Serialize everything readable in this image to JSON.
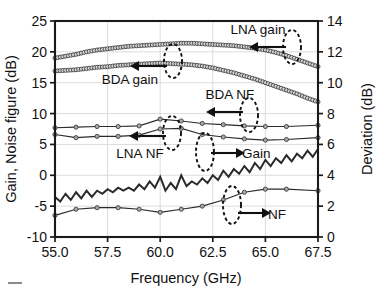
{
  "figure": {
    "name": "gain-noise-figure-vs-frequency-plot"
  },
  "axes": {
    "x_title": "Frequency (GHz)",
    "y_left_title": "Gain, Noise figure (dB)",
    "y_right_title": "Deviation (dB)",
    "x_ticks": [
      "55.0",
      "57.5",
      "60.0",
      "62.5",
      "65.0",
      "67.5"
    ],
    "y_left_ticks": [
      "-10",
      "-5",
      "0",
      "5",
      "10",
      "15",
      "20",
      "25"
    ],
    "y_right_ticks": [
      "0",
      "2",
      "4",
      "6",
      "8",
      "10",
      "12",
      "14"
    ]
  },
  "annotations": [
    {
      "label": "LNA gain",
      "arrow": "left"
    },
    {
      "label": "BDA gain",
      "arrow": "left"
    },
    {
      "label": "BDA NF",
      "arrow": "left"
    },
    {
      "label": "LNA NF",
      "arrow": "left"
    },
    {
      "label": "Gain",
      "arrow": "right"
    },
    {
      "label": "NF",
      "arrow": "right"
    }
  ],
  "chart_data": {
    "type": "line",
    "title": "",
    "xlabel": "Frequency (GHz)",
    "ylabel": "Gain, Noise figure (dB)",
    "y2label": "Deviation (dB)",
    "xlim": [
      55.0,
      67.5
    ],
    "ylim": [
      -10,
      25
    ],
    "y2lim": [
      0,
      14
    ],
    "grid": true,
    "legend_position": "inline-annotations",
    "series": [
      {
        "name": "LNA gain",
        "axis": "left",
        "unit": "dB",
        "marker": "open-circle",
        "x": [
          55.0,
          55.5,
          56.0,
          56.5,
          57.0,
          57.5,
          58.0,
          58.5,
          59.0,
          59.5,
          60.0,
          60.5,
          61.0,
          61.5,
          62.0,
          62.5,
          63.0,
          63.5,
          64.0,
          64.5,
          65.0,
          65.5,
          66.0,
          66.5,
          67.0,
          67.5
        ],
        "values": [
          19.0,
          19.3,
          19.6,
          20.0,
          20.3,
          20.5,
          20.7,
          20.9,
          21.0,
          21.1,
          21.2,
          21.3,
          21.4,
          21.4,
          21.3,
          21.2,
          21.1,
          21.0,
          20.8,
          20.6,
          20.3,
          19.9,
          19.4,
          18.8,
          18.2,
          17.6
        ]
      },
      {
        "name": "BDA gain",
        "axis": "left",
        "unit": "dB",
        "marker": "open-circle",
        "x": [
          55.0,
          55.5,
          56.0,
          56.5,
          57.0,
          57.5,
          58.0,
          58.5,
          59.0,
          59.5,
          60.0,
          60.5,
          61.0,
          61.5,
          62.0,
          62.5,
          63.0,
          63.5,
          64.0,
          64.5,
          65.0,
          65.5,
          66.0,
          66.5,
          67.0,
          67.5
        ],
        "values": [
          16.9,
          17.0,
          17.1,
          17.3,
          17.5,
          17.6,
          17.8,
          17.9,
          18.0,
          18.1,
          18.2,
          18.1,
          18.0,
          17.9,
          17.7,
          17.4,
          17.0,
          16.6,
          16.1,
          15.6,
          15.0,
          14.4,
          13.8,
          13.2,
          12.5,
          11.9
        ]
      },
      {
        "name": "BDA NF",
        "axis": "left",
        "unit": "dB",
        "marker": "small-circle",
        "x": [
          55.0,
          56.0,
          57.0,
          58.0,
          59.0,
          60.0,
          61.0,
          62.0,
          63.0,
          64.0,
          65.0,
          66.0,
          67.5
        ],
        "values": [
          7.7,
          7.8,
          7.9,
          7.9,
          8.0,
          9.1,
          8.8,
          8.4,
          8.2,
          8.0,
          7.9,
          7.9,
          8.1
        ]
      },
      {
        "name": "LNA NF",
        "axis": "left",
        "unit": "dB",
        "marker": "small-circle",
        "x": [
          55.0,
          56.0,
          57.0,
          58.0,
          59.0,
          60.0,
          61.0,
          62.0,
          63.0,
          64.0,
          65.0,
          66.0,
          67.5
        ],
        "values": [
          6.6,
          6.1,
          6.3,
          6.3,
          6.5,
          7.5,
          7.6,
          6.6,
          6.2,
          5.9,
          5.7,
          5.8,
          6.1
        ]
      },
      {
        "name": "Gain",
        "axis": "right",
        "unit": "dB",
        "marker": "none",
        "note": "noisy measured deviation trace",
        "x": [
          55.0,
          55.25,
          55.5,
          55.75,
          56.0,
          56.25,
          56.5,
          56.75,
          57.0,
          57.25,
          57.5,
          57.75,
          58.0,
          58.25,
          58.5,
          58.75,
          59.0,
          59.25,
          59.5,
          59.75,
          60.0,
          60.25,
          60.5,
          60.75,
          61.0,
          61.25,
          61.5,
          61.75,
          62.0,
          62.25,
          62.5,
          62.75,
          63.0,
          63.25,
          63.5,
          63.75,
          64.0,
          64.25,
          64.5,
          64.75,
          65.0,
          65.25,
          65.5,
          65.75,
          66.0,
          66.25,
          66.5,
          66.75,
          67.0,
          67.25,
          67.5
        ],
        "values": [
          2.6,
          2.3,
          2.8,
          2.4,
          2.9,
          2.5,
          3.0,
          2.6,
          3.0,
          2.8,
          3.1,
          2.9,
          3.2,
          3.0,
          3.2,
          3.0,
          3.4,
          3.1,
          3.6,
          3.2,
          3.9,
          3.0,
          3.5,
          3.1,
          4.0,
          3.3,
          3.6,
          3.4,
          3.8,
          3.5,
          4.0,
          3.7,
          4.3,
          3.9,
          4.4,
          4.1,
          4.6,
          4.2,
          4.8,
          4.4,
          5.0,
          4.6,
          5.1,
          4.8,
          5.3,
          4.9,
          5.4,
          5.1,
          5.6,
          5.2,
          5.7
        ]
      },
      {
        "name": "NF",
        "axis": "right",
        "unit": "dB",
        "marker": "small-circle",
        "x": [
          55.0,
          56.0,
          57.0,
          58.0,
          59.0,
          60.0,
          61.0,
          62.0,
          63.0,
          64.0,
          65.0,
          66.0,
          67.5
        ],
        "values": [
          1.4,
          1.8,
          1.9,
          1.9,
          1.8,
          1.6,
          1.8,
          2.0,
          2.4,
          2.9,
          3.1,
          3.1,
          3.0
        ]
      }
    ]
  }
}
